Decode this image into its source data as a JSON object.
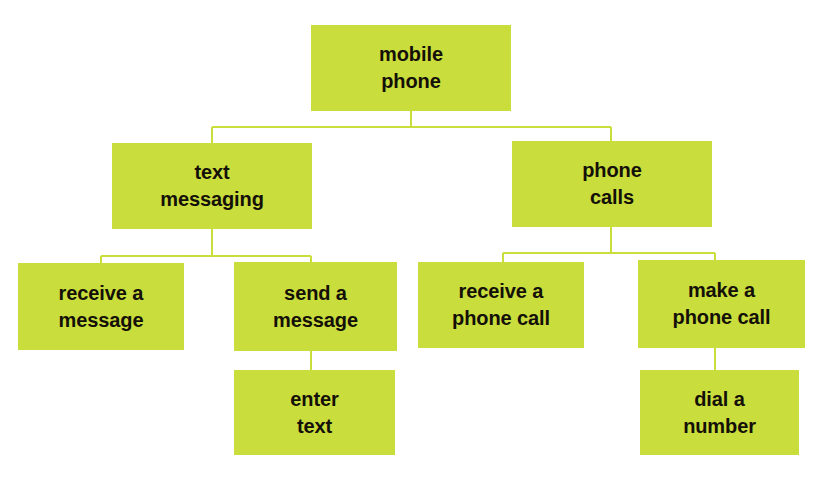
{
  "diagram": {
    "type": "hierarchy-tree",
    "root_label": "mobile\nphone",
    "colors": {
      "node_fill": "#c9dd3c",
      "connector": "#c9dd3c",
      "text": "#141008",
      "background": "#ffffff"
    },
    "nodes": {
      "mobile_phone": "mobile\nphone",
      "text_messaging": "text\nmessaging",
      "phone_calls": "phone\ncalls",
      "receive_a_message": "receive a\nmessage",
      "send_a_message": "send a\nmessage",
      "receive_a_phone_call": "receive a\nphone call",
      "make_a_phone_call": "make a\nphone call",
      "enter_text": "enter\ntext",
      "dial_a_number": "dial a\nnumber"
    },
    "edges": [
      {
        "from": "mobile_phone",
        "to": "text_messaging"
      },
      {
        "from": "mobile_phone",
        "to": "phone_calls"
      },
      {
        "from": "text_messaging",
        "to": "receive_a_message"
      },
      {
        "from": "text_messaging",
        "to": "send_a_message"
      },
      {
        "from": "phone_calls",
        "to": "receive_a_phone_call"
      },
      {
        "from": "phone_calls",
        "to": "make_a_phone_call"
      },
      {
        "from": "send_a_message",
        "to": "enter_text"
      },
      {
        "from": "make_a_phone_call",
        "to": "dial_a_number"
      }
    ]
  }
}
